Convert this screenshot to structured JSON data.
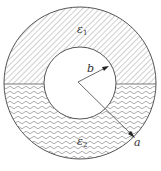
{
  "diagram": {
    "upper_region": {
      "label": "ε",
      "subscript": "1",
      "fill_pattern": "diagonal-hatch"
    },
    "lower_region": {
      "label": "ε",
      "subscript": "2",
      "fill_pattern": "wavy-lines"
    },
    "inner_radius_label": "b",
    "outer_radius_label": "a",
    "line_color": "#555555",
    "pattern_color": "#777777"
  }
}
